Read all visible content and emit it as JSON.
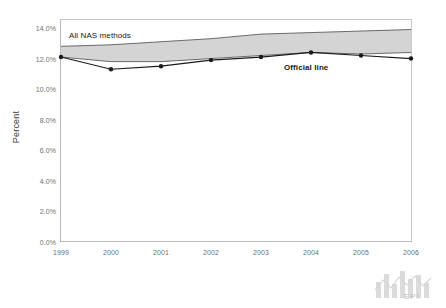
{
  "chart_data": {
    "type": "area",
    "title": "",
    "xlabel": "",
    "ylabel": "Percent",
    "categories": [
      "1999",
      "2000",
      "2001",
      "2002",
      "2003",
      "2004",
      "2005",
      "2006"
    ],
    "x": [
      1999,
      2000,
      2001,
      2002,
      2003,
      2004,
      2005,
      2006
    ],
    "ylim": [
      0.0,
      14.0
    ],
    "xlim": [
      1999,
      2006
    ],
    "grid": false,
    "legend_position": "inline-annotations",
    "y_ticks": [
      "0.0%",
      "2.0%",
      "4.0%",
      "6.0%",
      "8.0%",
      "10.0%",
      "12.0%",
      "14.0%"
    ],
    "y_tick_values": [
      0.0,
      2.0,
      4.0,
      6.0,
      8.0,
      10.0,
      12.0,
      14.0
    ],
    "series": [
      {
        "name": "Official line",
        "kind": "line",
        "marker": "circle",
        "color": "#1a1a1a",
        "values": [
          12.1,
          11.3,
          11.5,
          11.9,
          12.1,
          12.4,
          12.2,
          12.0
        ]
      },
      {
        "name": "All NAS methods",
        "kind": "band",
        "fill_color": "#d4d4d4",
        "edge_color": "#6b6b6b",
        "lower": [
          12.1,
          11.8,
          11.8,
          12.0,
          12.2,
          12.4,
          12.3,
          12.4
        ],
        "upper": [
          12.8,
          12.9,
          13.1,
          13.3,
          13.6,
          13.7,
          13.8,
          13.9
        ]
      }
    ],
    "annotations": [
      {
        "text": "All NAS methods",
        "x": 1999.1,
        "y": 13.5
      },
      {
        "text": "Official line",
        "x": 2003.4,
        "y": 11.4
      }
    ]
  },
  "branding": {
    "logo_text": "EPI",
    "logo_icon": "epi-bars-logo"
  }
}
